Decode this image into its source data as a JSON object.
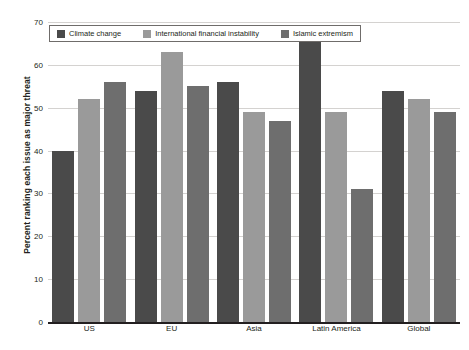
{
  "chart_data": {
    "type": "bar",
    "title": "",
    "subtitle": "",
    "xlabel": "",
    "ylabel": "Percent ranking each issue as major threat",
    "ylim": [
      0,
      70
    ],
    "yticks": [
      0,
      10,
      20,
      30,
      40,
      50,
      60,
      70
    ],
    "grid": true,
    "legend_position": "top-left",
    "categories": [
      "US",
      "EU",
      "Asia",
      "Latin America",
      "Global"
    ],
    "series": [
      {
        "name": "Climate change",
        "color": "#4a4a4a",
        "values": [
          40,
          54,
          56,
          66,
          54
        ]
      },
      {
        "name": "International financial instability",
        "color": "#9a9a9a",
        "values": [
          52,
          63,
          49,
          49,
          52
        ]
      },
      {
        "name": "Islamic extremism",
        "color": "#6e6e6e",
        "values": [
          56,
          55,
          47,
          31,
          49
        ]
      }
    ]
  }
}
